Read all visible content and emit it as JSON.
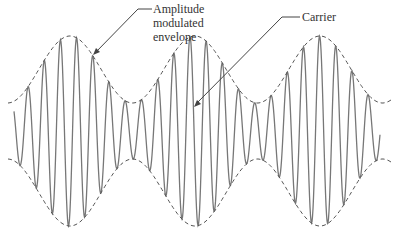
{
  "diagram": {
    "type": "amplitude-modulated-waveform",
    "labels": {
      "envelope_line1": "Amplitude",
      "envelope_line2": "modulated",
      "envelope_line3": "envelope",
      "carrier": "Carrier"
    },
    "colors": {
      "wave": "#777777",
      "envelope": "#555555",
      "text": "#333333"
    }
  }
}
